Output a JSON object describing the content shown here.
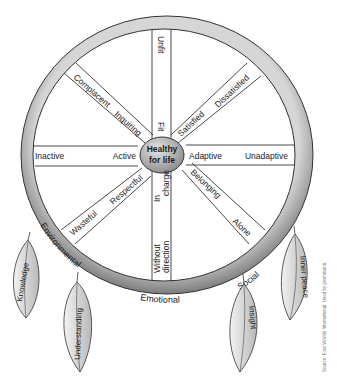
{
  "diagram": {
    "center": {
      "line1": "Healthy",
      "line2": "for life"
    },
    "ring_labels": {
      "environmental": "Environmental",
      "emotional": "Emotional",
      "social": "Social"
    },
    "spokes": {
      "top": {
        "outer": "Unfit",
        "inner": "Fit"
      },
      "upper_left": {
        "outer": "Complacent",
        "inner": "Inquiring"
      },
      "upper_right": {
        "outer": "Dissatisfied",
        "inner": "Satisfied"
      },
      "left": {
        "outer": "Inactive",
        "inner": "Active"
      },
      "right": {
        "outer": "Unadaptive",
        "inner": "Adaptive"
      },
      "lower_left": {
        "outer": "Wasteful",
        "inner": "Respectful"
      },
      "bottom": {
        "outer_line1": "Without",
        "outer_line2": "direction",
        "inner_line1": "In",
        "inner_line2": "charge"
      },
      "lower_right": {
        "outer": "Alone",
        "inner": "Belonging"
      }
    },
    "feathers": [
      "Knowledge",
      "Understanding",
      "Insight",
      "Inner peace"
    ],
    "source": "Source: Four Worlds International. Used by permission."
  },
  "colors": {
    "ring": "#8a8a8a",
    "ring_light": "#c4c4c4",
    "hub": "#9a9a9a",
    "line": "#333333"
  }
}
